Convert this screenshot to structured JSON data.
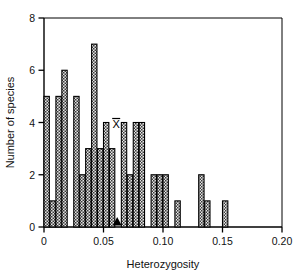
{
  "chart_data": {
    "type": "bar",
    "title": "",
    "subtitle": "",
    "xlabel": "Heterozygosity",
    "ylabel": "Number of species",
    "xlim": [
      0,
      0.2
    ],
    "ylim": [
      0,
      8
    ],
    "bin_width": 0.005,
    "grid": false,
    "legend": null,
    "x_ticks": [
      0,
      0.05,
      0.1,
      0.15,
      0.2
    ],
    "x_tick_labels": [
      "0",
      "0.05",
      "0.10",
      "0.15",
      "0.20"
    ],
    "y_ticks": [
      0,
      2,
      4,
      6,
      8
    ],
    "y_tick_labels": [
      "0",
      "2",
      "4",
      "6",
      "8"
    ],
    "bar_fill": "#d9d9d9",
    "bar_pattern": "checkered",
    "bar_edge_color": "#000000",
    "axis_color": "#000000",
    "bin_starts": [
      0.0,
      0.005,
      0.01,
      0.015,
      0.02,
      0.025,
      0.03,
      0.035,
      0.04,
      0.045,
      0.05,
      0.055,
      0.06,
      0.065,
      0.07,
      0.075,
      0.08,
      0.085,
      0.09,
      0.095,
      0.1,
      0.105,
      0.11,
      0.115,
      0.12,
      0.125,
      0.13,
      0.135,
      0.14,
      0.145,
      0.15,
      0.155
    ],
    "categories": [
      "0.000",
      "0.005",
      "0.010",
      "0.015",
      "0.020",
      "0.025",
      "0.030",
      "0.035",
      "0.040",
      "0.045",
      "0.050",
      "0.055",
      "0.060",
      "0.065",
      "0.070",
      "0.075",
      "0.080",
      "0.085",
      "0.090",
      "0.095",
      "0.100",
      "0.105",
      "0.110",
      "0.115",
      "0.120",
      "0.125",
      "0.130",
      "0.135",
      "0.140",
      "0.145",
      "0.150",
      "0.155"
    ],
    "values": [
      5,
      1,
      5,
      6,
      0,
      5,
      2,
      3,
      7,
      3,
      4,
      3,
      0,
      4,
      2,
      4,
      4,
      0,
      2,
      2,
      2,
      0,
      1,
      0,
      0,
      0,
      2,
      1,
      0,
      0,
      1,
      0
    ],
    "annotations": [
      {
        "name": "mean-marker",
        "label": "X̄",
        "x": 0.0615,
        "y": 0,
        "type": "arrow-up",
        "note": "mean heterozygosity marker on x-axis with overbar X label above"
      }
    ]
  },
  "labels": {
    "mean_symbol": "X",
    "x_axis_title": "Heterozygosity",
    "y_axis_title": "Number of species"
  }
}
